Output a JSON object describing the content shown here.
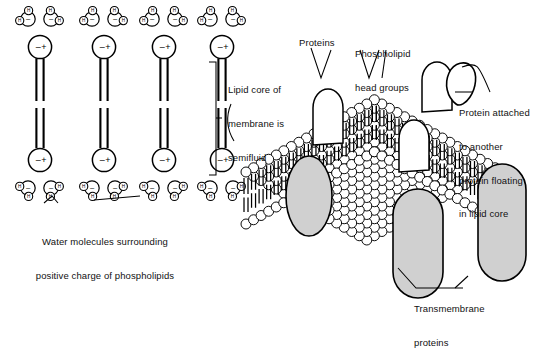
{
  "figure": {
    "stroke_color": "#000000",
    "protein_fill": "#d0d0d0",
    "head_fill": "#ffffff",
    "background": "#ffffff"
  },
  "left_panel": {
    "name": "phospholipid-bilayer-cross-section",
    "phospholipid_count": 4,
    "head_charge_labels": {
      "negative": "–",
      "positive": "+"
    },
    "water_atom_label": "H",
    "water_charge_label": "–",
    "water_molecules_per_head": 2,
    "caption": "Water molecules surrounding\npositive charge of phospholipids",
    "caption_line1": "Water molecules surrounding",
    "caption_line2": "positive charge of phospholipids"
  },
  "bracket_label": {
    "name": "lipid-core-bracket",
    "line1": "Lipid core of",
    "line2": "membrane is",
    "line3": "semifluid",
    "text": "Lipid core of membrane is semifluid"
  },
  "right_panel": {
    "name": "membrane-3d-model",
    "labels": {
      "proteins": "Proteins",
      "phospholipid_head_groups_line1": "Phospholipid",
      "phospholipid_head_groups_line2": "head groups",
      "attached_protein_line1": "Protein attached",
      "attached_protein_line2": "to another",
      "attached_protein_line3": "protein floating",
      "attached_protein_line4": "in lipid core",
      "transmembrane_line1": "Transmembrane",
      "transmembrane_line2": "proteins"
    },
    "counts": {
      "transmembrane_proteins": 3,
      "surface_dome_proteins": 3,
      "attached_protein": 1
    }
  }
}
